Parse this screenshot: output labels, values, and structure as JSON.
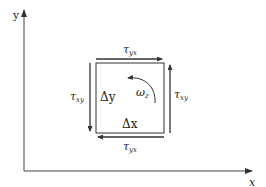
{
  "diagram": {
    "axes": {
      "x_label": "x",
      "y_label": "y"
    },
    "element": {
      "width_label": "Δx",
      "height_label": "Δy",
      "rotation_label": "ω",
      "rotation_subscript": "z"
    },
    "stresses": {
      "top": {
        "symbol": "τ",
        "subscript": "yx",
        "direction": "right"
      },
      "bottom": {
        "symbol": "τ",
        "subscript": "yx",
        "direction": "left"
      },
      "left": {
        "symbol": "τ",
        "subscript": "xy",
        "direction": "down"
      },
      "right": {
        "symbol": "τ",
        "subscript": "xy",
        "direction": "up"
      }
    },
    "colors": {
      "line": "#333333",
      "background": "#ffffff"
    }
  }
}
